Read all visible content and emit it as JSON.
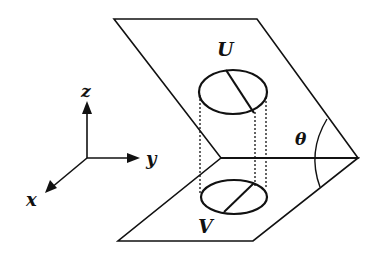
{
  "labels": {
    "upper_region": "U",
    "lower_region": "V",
    "angle": "θ",
    "axis_x": "x",
    "axis_y": "y",
    "axis_z": "z"
  },
  "colors": {
    "ink": "#111111",
    "background": "#ffffff"
  }
}
